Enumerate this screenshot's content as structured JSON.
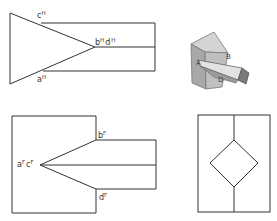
{
  "figure": {
    "top_view": {
      "labels": [
        {
          "id": "c",
          "base": "c",
          "sup": "H"
        },
        {
          "id": "bd",
          "base": "b",
          "sup": "H",
          "base2": "d",
          "sup2": "H"
        },
        {
          "id": "a",
          "base": "a",
          "sup": "H"
        }
      ]
    },
    "pictorial": {
      "labels": [
        {
          "id": "A",
          "text": "A"
        },
        {
          "id": "B",
          "text": "B"
        },
        {
          "id": "D",
          "text": "D"
        }
      ]
    },
    "front_view": {
      "labels": [
        {
          "id": "b",
          "base": "b",
          "sup": "F"
        },
        {
          "id": "ac",
          "base": "a",
          "sup": "F",
          "base2": "c",
          "sup2": "F"
        },
        {
          "id": "d",
          "base": "d",
          "sup": "F"
        }
      ]
    },
    "side_view": {
      "labels": []
    }
  },
  "colors": {
    "line": "#333333",
    "shade_light": "#d8d8d8",
    "shade_mid": "#bdbdbd",
    "shade_dark": "#8a8a8a"
  }
}
